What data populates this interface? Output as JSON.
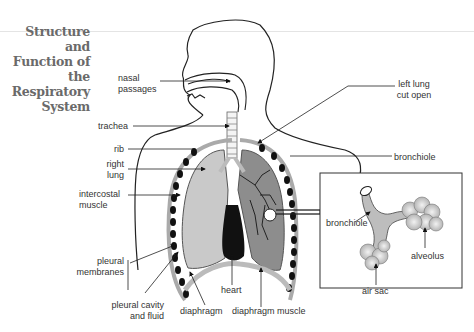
{
  "title": {
    "lines": [
      "Structure",
      "and",
      "Function of",
      "the",
      "Respiratory",
      "System"
    ]
  },
  "labels": {
    "nasal_passages": [
      "nasal",
      "passages"
    ],
    "trachea": "trachea",
    "rib": "rib",
    "right_lung": [
      "right",
      "lung"
    ],
    "intercostal_muscle": [
      "intercostal",
      "muscle"
    ],
    "pleural_membranes": [
      "pleural",
      "membranes"
    ],
    "pleural_cavity": [
      "pleural cavity",
      "and fluid"
    ],
    "diaphragm": "diaphragm",
    "heart": "heart",
    "diaphragm_muscle": "diaphragm muscle",
    "left_lung": [
      "left lung",
      "cut open"
    ],
    "bronchiole": "bronchiole"
  },
  "inset": {
    "bronchiole": "bronchiole",
    "alveolus": "alveolus",
    "air_sac": "air sac"
  },
  "colors": {
    "lung_fill": "#c9c9c9",
    "lung_dark": "#8a8a8a",
    "line": "#222222",
    "title": "#6a6a6a"
  }
}
